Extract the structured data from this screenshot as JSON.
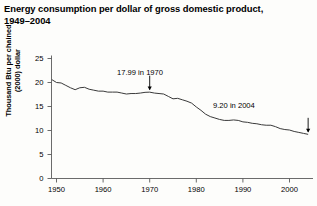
{
  "title": "Energy consumption per dollar of gross domestic product,\n1949–2004",
  "axis": {
    "y_title": "Thousand Btu per chained\n(2000) dollar",
    "y_ticks": [
      "0",
      "5",
      "10",
      "15",
      "20",
      "25"
    ],
    "x_ticks": [
      "1950",
      "1960",
      "1970",
      "1980",
      "1990",
      "2000"
    ]
  },
  "annotations": {
    "peak": "17.99 in 1970",
    "last": "9.20 in 2004"
  },
  "colors": {
    "line": "#3a3a3a",
    "axis": "#5a5a5a",
    "text": "#000000",
    "background": "#fdfdfb"
  },
  "chart_data": {
    "type": "line",
    "xlabel": "",
    "ylabel": "Thousand Btu per chained (2000) dollar",
    "xlim": [
      1949,
      2004
    ],
    "ylim": [
      0,
      25
    ],
    "ytick_values": [
      0,
      5,
      10,
      15,
      20,
      25
    ],
    "xtick_values": [
      1950,
      1960,
      1970,
      1980,
      1990,
      2000
    ],
    "grid": false,
    "legend": null,
    "annotations": [
      {
        "text": "17.99 in 1970",
        "x": 1970,
        "y": 17.99
      },
      {
        "text": "9.20 in 2004",
        "x": 2004,
        "y": 9.2
      }
    ],
    "x": [
      1949,
      1950,
      1951,
      1952,
      1953,
      1954,
      1955,
      1956,
      1957,
      1958,
      1959,
      1960,
      1961,
      1962,
      1963,
      1964,
      1965,
      1966,
      1967,
      1968,
      1969,
      1970,
      1971,
      1972,
      1973,
      1974,
      1975,
      1976,
      1977,
      1978,
      1979,
      1980,
      1981,
      1982,
      1983,
      1984,
      1985,
      1986,
      1987,
      1988,
      1989,
      1990,
      1991,
      1992,
      1993,
      1994,
      1995,
      1996,
      1997,
      1998,
      1999,
      2000,
      2001,
      2002,
      2003,
      2004
    ],
    "values": [
      20.6,
      20.0,
      19.9,
      19.4,
      18.9,
      18.5,
      18.9,
      19.0,
      18.6,
      18.4,
      18.2,
      18.2,
      18.0,
      18.0,
      18.0,
      17.8,
      17.6,
      17.7,
      17.7,
      17.8,
      17.95,
      17.99,
      17.8,
      17.7,
      17.6,
      17.1,
      16.6,
      16.7,
      16.4,
      16.1,
      15.7,
      14.9,
      14.2,
      13.4,
      12.9,
      12.6,
      12.3,
      12.1,
      12.1,
      12.2,
      12.1,
      11.8,
      11.7,
      11.5,
      11.4,
      11.2,
      11.1,
      11.1,
      10.8,
      10.4,
      10.2,
      10.1,
      9.8,
      9.6,
      9.4,
      9.2
    ],
    "series": [
      {
        "name": "Energy intensity",
        "values": [
          20.6,
          20.0,
          19.9,
          19.4,
          18.9,
          18.5,
          18.9,
          19.0,
          18.6,
          18.4,
          18.2,
          18.2,
          18.0,
          18.0,
          18.0,
          17.8,
          17.6,
          17.7,
          17.7,
          17.8,
          17.95,
          17.99,
          17.8,
          17.7,
          17.6,
          17.1,
          16.6,
          16.7,
          16.4,
          16.1,
          15.7,
          14.9,
          14.2,
          13.4,
          12.9,
          12.6,
          12.3,
          12.1,
          12.1,
          12.2,
          12.1,
          11.8,
          11.7,
          11.5,
          11.4,
          11.2,
          11.1,
          11.1,
          10.8,
          10.4,
          10.2,
          10.1,
          9.8,
          9.6,
          9.4,
          9.2
        ]
      }
    ]
  }
}
